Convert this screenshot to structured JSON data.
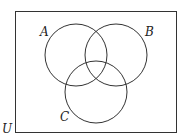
{
  "diagram": {
    "type": "venn",
    "universe_label": "U",
    "sets": [
      {
        "label": "A"
      },
      {
        "label": "B"
      },
      {
        "label": "C"
      }
    ],
    "colors": {
      "stroke": "#333333",
      "background": "#ffffff"
    }
  }
}
